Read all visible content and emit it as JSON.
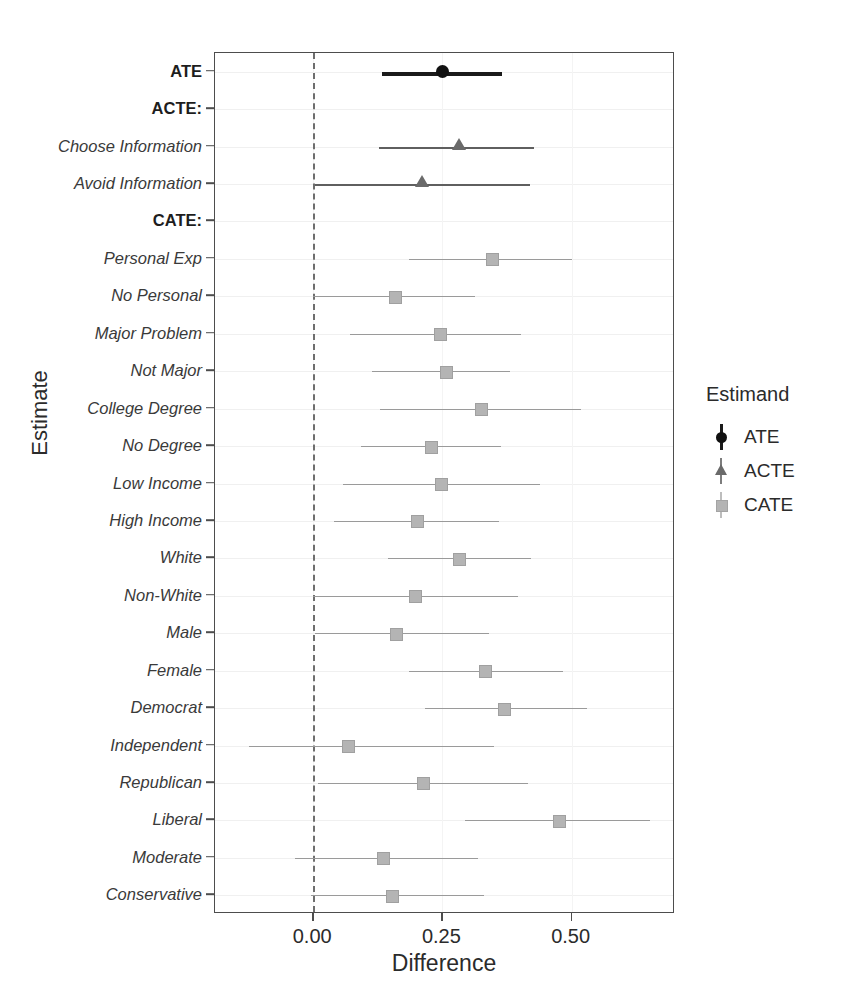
{
  "chart_data": {
    "type": "scatter",
    "title": "",
    "xlabel": "Difference",
    "ylabel": "Estimate",
    "xlim": [
      -0.19,
      0.7
    ],
    "xticks": [
      0.0,
      0.25,
      0.5
    ],
    "xticklabels": [
      "0.00",
      "0.25",
      "0.50"
    ],
    "grid": true,
    "reference_line": 0.0,
    "legend": {
      "title": "Estimand",
      "position": "right",
      "entries": [
        {
          "name": "ATE",
          "marker": "circle",
          "color": "#111111"
        },
        {
          "name": "ACTE",
          "marker": "triangle",
          "color": "#6a6a6a"
        },
        {
          "name": "CATE",
          "marker": "square",
          "color": "#b4b4b4"
        }
      ]
    },
    "categories": [
      "ATE",
      "ACTE:",
      "Choose Information",
      "Avoid Information",
      "CATE:",
      "Personal Exp",
      "No Personal",
      "Major Problem",
      "Not Major",
      "College Degree",
      "No Degree",
      "Low Income",
      "High Income",
      "White",
      "Non-White",
      "Male",
      "Female",
      "Democrat",
      "Independent",
      "Republican",
      "Liberal",
      "Moderate",
      "Conservative"
    ],
    "points": [
      {
        "label": "ATE",
        "estimand": "ATE",
        "header": false,
        "estimate": 0.25,
        "low": 0.134,
        "high": 0.366
      },
      {
        "label": "ACTE:",
        "estimand": "none",
        "header": true,
        "estimate": null,
        "low": null,
        "high": null
      },
      {
        "label": "Choose Information",
        "estimand": "ACTE",
        "header": false,
        "estimate": 0.282,
        "low": 0.128,
        "high": 0.428
      },
      {
        "label": "Avoid Information",
        "estimand": "ACTE",
        "header": false,
        "estimate": 0.21,
        "low": 0.004,
        "high": 0.42
      },
      {
        "label": "CATE:",
        "estimand": "none",
        "header": true,
        "estimate": null,
        "low": null,
        "high": null
      },
      {
        "label": "Personal Exp",
        "estimand": "CATE",
        "header": false,
        "estimate": 0.345,
        "low": 0.185,
        "high": 0.5
      },
      {
        "label": "No Personal",
        "estimand": "CATE",
        "header": false,
        "estimate": 0.157,
        "low": 0.0,
        "high": 0.313
      },
      {
        "label": "Major Problem",
        "estimand": "CATE",
        "header": false,
        "estimate": 0.245,
        "low": 0.072,
        "high": 0.402
      },
      {
        "label": "Not Major",
        "estimand": "CATE",
        "header": false,
        "estimate": 0.255,
        "low": 0.113,
        "high": 0.381
      },
      {
        "label": "College Degree",
        "estimand": "CATE",
        "header": false,
        "estimate": 0.323,
        "low": 0.13,
        "high": 0.519
      },
      {
        "label": "No Degree",
        "estimand": "CATE",
        "header": false,
        "estimate": 0.226,
        "low": 0.093,
        "high": 0.364
      },
      {
        "label": "Low Income",
        "estimand": "CATE",
        "header": false,
        "estimate": 0.247,
        "low": 0.058,
        "high": 0.438
      },
      {
        "label": "High Income",
        "estimand": "CATE",
        "header": false,
        "estimate": 0.2,
        "low": 0.041,
        "high": 0.36
      },
      {
        "label": "White",
        "estimand": "CATE",
        "header": false,
        "estimate": 0.282,
        "low": 0.144,
        "high": 0.422
      },
      {
        "label": "Non-White",
        "estimand": "CATE",
        "header": false,
        "estimate": 0.196,
        "low": 0.0,
        "high": 0.397
      },
      {
        "label": "Male",
        "estimand": "CATE",
        "header": false,
        "estimate": 0.159,
        "low": 0.004,
        "high": 0.34
      },
      {
        "label": "Female",
        "estimand": "CATE",
        "header": false,
        "estimate": 0.331,
        "low": 0.185,
        "high": 0.484
      },
      {
        "label": "Democrat",
        "estimand": "CATE",
        "header": false,
        "estimate": 0.368,
        "low": 0.216,
        "high": 0.529
      },
      {
        "label": "Independent",
        "estimand": "CATE",
        "header": false,
        "estimate": 0.066,
        "low": -0.124,
        "high": 0.35
      },
      {
        "label": "Republican",
        "estimand": "CATE",
        "header": false,
        "estimate": 0.212,
        "low": 0.01,
        "high": 0.416
      },
      {
        "label": "Liberal",
        "estimand": "CATE",
        "header": false,
        "estimate": 0.475,
        "low": 0.294,
        "high": 0.652
      },
      {
        "label": "Moderate",
        "estimand": "CATE",
        "header": false,
        "estimate": 0.134,
        "low": -0.035,
        "high": 0.319
      },
      {
        "label": "Conservative",
        "estimand": "CATE",
        "header": false,
        "estimate": 0.151,
        "low": -0.005,
        "high": 0.33
      }
    ]
  },
  "axes": {
    "x_title": "Difference",
    "y_title": "Estimate"
  },
  "legend": {
    "title": "Estimand",
    "items": [
      "ATE",
      "ACTE",
      "CATE"
    ]
  }
}
